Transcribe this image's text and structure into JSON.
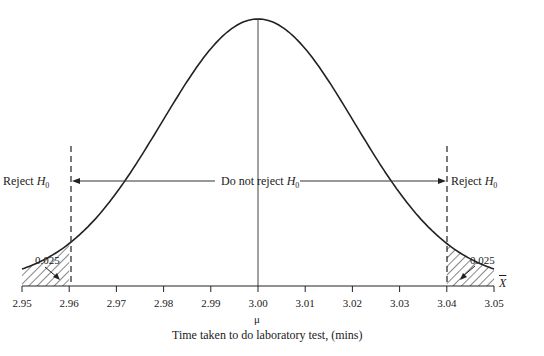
{
  "page_header": "Hypothesis testing  169",
  "chart_data": {
    "type": "line",
    "xlabel": "Time taken to do laboratory test, (mins)",
    "ylabel": "",
    "x_axis_symbol": "X̄",
    "mean_label": "μ",
    "mean": 3.0,
    "std_error": 0.0204,
    "xlim": [
      2.95,
      3.05
    ],
    "x_ticks": [
      "2.95",
      "2.96",
      "2.97",
      "2.98",
      "2.99",
      "3.00",
      "3.01",
      "3.02",
      "3.03",
      "3.04",
      "3.05"
    ],
    "critical_values": [
      2.96,
      3.04
    ],
    "tail_areas": [
      0.025,
      0.025
    ],
    "regions": [
      {
        "label": "Reject H0",
        "range": [
          2.95,
          2.96
        ]
      },
      {
        "label": "Do not reject H0",
        "range": [
          2.96,
          3.04
        ]
      },
      {
        "label": "Reject H0",
        "range": [
          3.04,
          3.05
        ]
      }
    ],
    "grid": false
  },
  "labels": {
    "reject_left": "Reject",
    "reject_right": "Reject",
    "do_not_reject": "Do not reject",
    "h": "H",
    "h_sub": "0",
    "tail_left": "0.025",
    "tail_right": "0.025",
    "mu": "μ",
    "xbar": "X",
    "xlabel": "Time taken to do laboratory test, (mins)"
  }
}
